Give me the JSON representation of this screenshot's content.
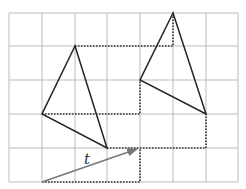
{
  "diagram": {
    "grid": {
      "x_lines": [
        9,
        42,
        75,
        107,
        140,
        173,
        206,
        238
      ],
      "y_lines": [
        13,
        46,
        80,
        114,
        148,
        182
      ],
      "color": "#bbbbbb"
    },
    "original_triangle": {
      "points": [
        [
          75,
          46
        ],
        [
          42,
          114
        ],
        [
          107,
          148
        ]
      ],
      "color": "#222222"
    },
    "image_triangle": {
      "points": [
        [
          173,
          13
        ],
        [
          140,
          80
        ],
        [
          206,
          114
        ]
      ],
      "color": "#222222"
    },
    "vector": {
      "label": "t",
      "from": [
        42,
        182
      ],
      "to": [
        140,
        148
      ],
      "color": "#777777"
    },
    "dotted_guides": [
      [
        [
          75,
          46
        ],
        [
          173,
          46
        ],
        [
          173,
          13
        ]
      ],
      [
        [
          42,
          114
        ],
        [
          140,
          114
        ],
        [
          140,
          80
        ]
      ],
      [
        [
          107,
          148
        ],
        [
          206,
          148
        ],
        [
          206,
          114
        ]
      ],
      [
        [
          42,
          182
        ],
        [
          140,
          182
        ],
        [
          140,
          148
        ]
      ]
    ]
  }
}
